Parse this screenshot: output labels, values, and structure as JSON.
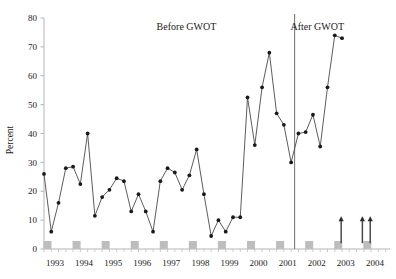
{
  "chart_data": {
    "type": "line",
    "title": "",
    "xlabel": "",
    "ylabel": "Percent",
    "ylim": [
      0,
      80
    ],
    "ytick_step": 10,
    "yticks": [
      "0",
      "10",
      "20",
      "30",
      "40",
      "50",
      "60",
      "70",
      "80"
    ],
    "xlim": [
      1993.0,
      2004.9
    ],
    "xticks": [
      "1993",
      "1994",
      "1995",
      "1996",
      "1997",
      "1998",
      "1999",
      "2000",
      "2001",
      "2002",
      "2003",
      "2004"
    ],
    "grid": false,
    "legend": "none",
    "marker": "filled-circle",
    "line_color": "#4a4a4a",
    "marker_color": "#1a1a1a",
    "baseline_marker_color": "#bdbdbd",
    "divider_color": "#6e6e6e",
    "series": [
      {
        "name": "Percent",
        "x": [
          1993.0,
          1993.25,
          1993.5,
          1993.75,
          1994.0,
          1994.25,
          1994.5,
          1994.75,
          1995.0,
          1995.25,
          1995.5,
          1995.75,
          1996.0,
          1996.25,
          1996.5,
          1996.75,
          1997.0,
          1997.25,
          1997.5,
          1997.75,
          1998.0,
          1998.25,
          1998.5,
          1998.75,
          1999.0,
          1999.25,
          1999.5,
          1999.75,
          2000.0,
          2000.25,
          2000.5,
          2000.75,
          2001.0,
          2001.25,
          2001.5,
          2001.75,
          2002.0,
          2002.25,
          2002.5,
          2002.75,
          2003.0,
          2003.25,
          2003.5,
          2003.75,
          2004.0,
          2004.25,
          2004.5,
          2004.75
        ],
        "values": [
          26,
          6,
          16,
          28,
          28.5,
          22.5,
          40,
          11.5,
          18,
          20.5,
          24.5,
          23.5,
          13,
          19,
          13,
          6,
          23.5,
          28,
          26.5,
          20.5,
          25.5,
          34.5,
          19,
          4.5,
          10,
          6,
          11,
          11,
          52.5,
          36,
          56,
          68,
          47,
          43,
          30,
          40,
          40.5,
          46.5,
          35.5,
          56,
          74,
          73,
          2.5,
          2.5,
          2.5,
          2.5,
          2.5,
          2.5
        ]
      }
    ],
    "baseline_markers": {
      "note": "gray squares at zero for each year",
      "x": [
        "1993",
        "1994",
        "1995",
        "1996",
        "1997",
        "1998",
        "1999",
        "2000",
        "2001",
        "2002",
        "2003",
        "2004"
      ],
      "y": 0
    },
    "annotations": [
      {
        "name": "before-gwot-label",
        "text": "Before GWOT",
        "x": 1997.9,
        "y": 76
      },
      {
        "name": "after-gwot-label",
        "text": "After GWOT",
        "x": 2002.4,
        "y": 76
      },
      {
        "name": "gwot-divider",
        "type": "vline",
        "x": 2001.62
      }
    ],
    "arrows": [
      {
        "name": "censored-arrow-2003",
        "x": 2003.22,
        "y_from": 2,
        "y_to": 11
      },
      {
        "name": "censored-arrow-2004a",
        "x": 2003.95,
        "y_from": 2,
        "y_to": 11
      },
      {
        "name": "censored-arrow-2004b",
        "x": 2004.22,
        "y_from": 2,
        "y_to": 11
      }
    ]
  }
}
